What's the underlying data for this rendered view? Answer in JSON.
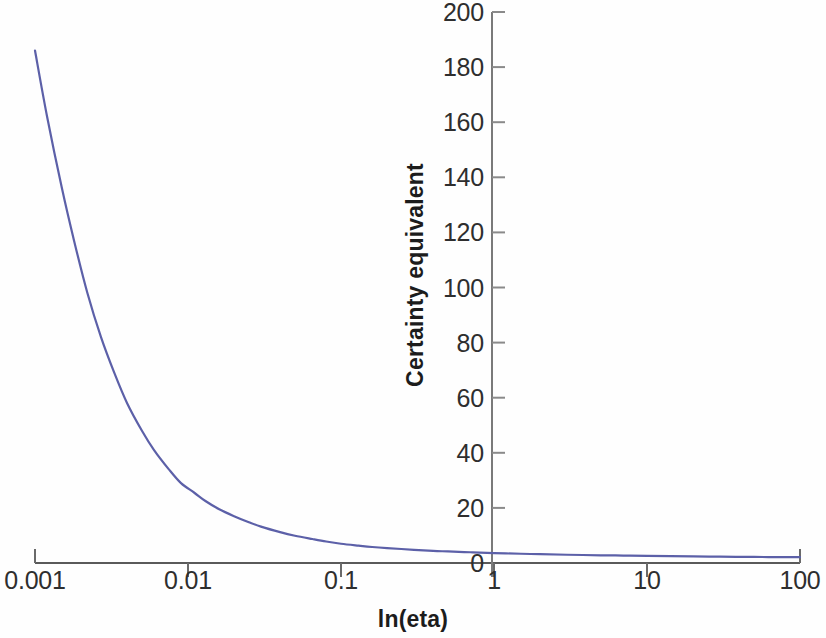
{
  "chart_data": {
    "type": "line",
    "title": "",
    "xlabel": "ln(eta)",
    "ylabel": "Certainty equivalent",
    "xscale": "log",
    "yscale": "linear",
    "xlim": [
      0.001,
      100
    ],
    "ylim": [
      0,
      200
    ],
    "grid": false,
    "legend": null,
    "xticks": [
      {
        "value": 0.001,
        "label": "0.001"
      },
      {
        "value": 0.01,
        "label": "0.01"
      },
      {
        "value": 0.1,
        "label": "0.1"
      },
      {
        "value": 1,
        "label": "1"
      },
      {
        "value": 10,
        "label": "10"
      },
      {
        "value": 100,
        "label": "100"
      }
    ],
    "yticks": [
      {
        "value": 0,
        "label": "0"
      },
      {
        "value": 20,
        "label": "20"
      },
      {
        "value": 40,
        "label": "40"
      },
      {
        "value": 60,
        "label": "60"
      },
      {
        "value": 80,
        "label": "80"
      },
      {
        "value": 100,
        "label": "100"
      },
      {
        "value": 120,
        "label": "120"
      },
      {
        "value": 140,
        "label": "140"
      },
      {
        "value": 160,
        "label": "160"
      },
      {
        "value": 180,
        "label": "180"
      },
      {
        "value": 200,
        "label": "200"
      }
    ],
    "series": [
      {
        "name": "Certainty equivalent",
        "color": "#5c60a8",
        "linewidth": 2.2,
        "x": [
          0.001,
          0.0012,
          0.0015,
          0.0018,
          0.0022,
          0.0027,
          0.0033,
          0.004,
          0.005,
          0.006,
          0.0075,
          0.009,
          0.011,
          0.013,
          0.016,
          0.02,
          0.025,
          0.03,
          0.04,
          0.05,
          0.065,
          0.08,
          0.1,
          0.13,
          0.16,
          0.2,
          0.3,
          0.4,
          0.5,
          0.7,
          1,
          1.5,
          2,
          3,
          5,
          7,
          10,
          20,
          30,
          50,
          70,
          100
        ],
        "y": [
          186,
          162,
          136,
          117,
          98,
          82,
          69,
          58,
          48,
          41,
          34,
          29,
          25.5,
          22.5,
          19.5,
          17,
          14.8,
          13.2,
          11.2,
          9.9,
          8.7,
          7.8,
          7.0,
          6.3,
          5.8,
          5.4,
          4.8,
          4.4,
          4.2,
          3.9,
          3.6,
          3.35,
          3.2,
          3.0,
          2.8,
          2.7,
          2.6,
          2.4,
          2.3,
          2.2,
          2.15,
          2.1
        ]
      }
    ]
  },
  "axes": {
    "axis_color": "#555555",
    "tick_color": "#707070",
    "tick_label_color": "#2e2e2e",
    "background": "#ffffff"
  }
}
